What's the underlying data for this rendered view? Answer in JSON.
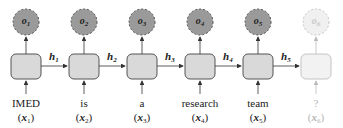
{
  "colors": {
    "cell_fill": "#d9d9d9",
    "cell_stroke": "#555555",
    "output_fill": "#9a9a9a",
    "output_stroke": "#555555",
    "faded_fill": "#f2f2f2",
    "faded_stroke": "#c4c4c4"
  },
  "steps": [
    {
      "word": "IMED",
      "x": "x",
      "x_sub": "1",
      "o": "o",
      "o_sub": "1",
      "h": "h",
      "h_sub": "1"
    },
    {
      "word": "is",
      "x": "x",
      "x_sub": "2",
      "o": "o",
      "o_sub": "2",
      "h": "h",
      "h_sub": "2"
    },
    {
      "word": "a",
      "x": "x",
      "x_sub": "3",
      "o": "o",
      "o_sub": "3",
      "h": "h",
      "h_sub": "3"
    },
    {
      "word": "research",
      "x": "x",
      "x_sub": "4",
      "o": "o",
      "o_sub": "4",
      "h": "h",
      "h_sub": "4"
    },
    {
      "word": "team",
      "x": "x",
      "x_sub": "5",
      "o": "o",
      "o_sub": "5",
      "h": "h",
      "h_sub": "5"
    },
    {
      "word": "?",
      "x": "x",
      "x_sub": "6",
      "o": "o",
      "o_sub": "6",
      "faded": true
    }
  ]
}
